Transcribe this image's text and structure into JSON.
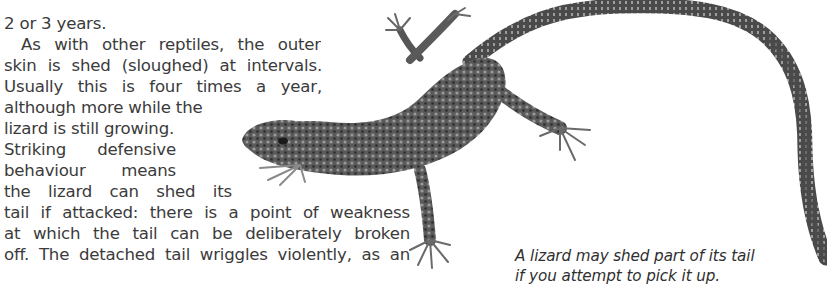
{
  "document": {
    "body_lines": [
      "vigorous",
      "2 or 3 years.",
      "As with other reptiles, the outer",
      "skin is shed (sloughed) at intervals.",
      "Usually this is four times a year,",
      "although more while the",
      "lizard is still growing.",
      "Striking defensive",
      "behaviour means",
      "the lizard can shed its",
      "tail if attacked: there is a point of weakness",
      "at which the tail can be deliberately broken",
      "off. The detached tail wriggles violently, as an"
    ],
    "caption_lines": [
      "A lizard may shed part of its tail",
      "if you attempt to pick it up."
    ],
    "figure": {
      "subject": "lizard-photo",
      "description": "Lizard with long curving tail"
    },
    "colors": {
      "text": "#3b3b3b",
      "caption": "#2f2f2f",
      "background": "#ffffff",
      "lizard_dark": "#2e2e2e",
      "lizard_mid": "#6a6a6a",
      "lizard_light": "#a8a8a8"
    }
  }
}
